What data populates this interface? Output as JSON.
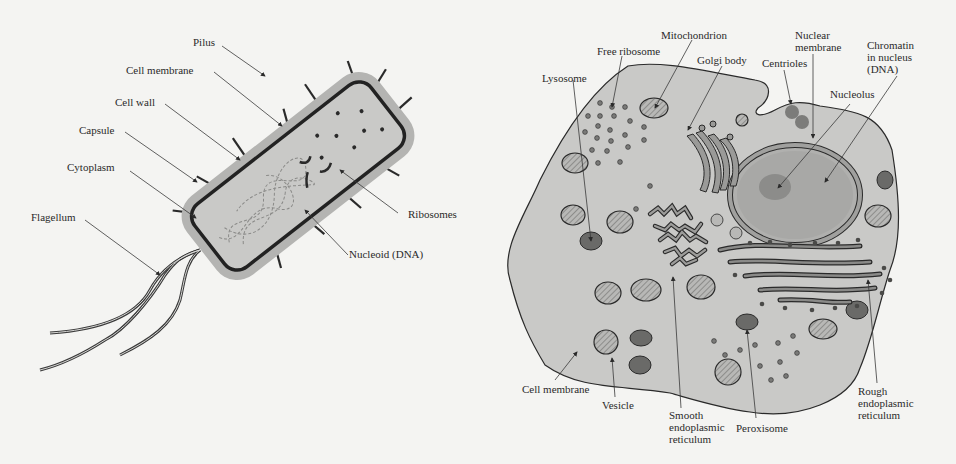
{
  "prokaryote": {
    "labels": {
      "pilus": "Pilus",
      "cell_membrane": "Cell membrane",
      "cell_wall": "Cell wall",
      "capsule": "Capsule",
      "cytoplasm": "Cytoplasm",
      "flagellum": "Flagellum",
      "ribosomes": "Ribosomes",
      "nucleoid": "Nucleoid (DNA)"
    }
  },
  "eukaryote": {
    "labels": {
      "mitochondrion": "Mitochondrion",
      "free_ribosome": "Free ribosome",
      "golgi_body": "Golgi body",
      "lysosome": "Lysosome",
      "nuclear_membrane": "Nuclear\nmembrane",
      "centrioles": "Centrioles",
      "chromatin": "Chromatin\nin nucleus\n(DNA)",
      "nucleolus": "Nucleolus",
      "cell_membrane": "Cell membrane",
      "vesicle": "Vesicle",
      "smooth_er": "Smooth\nendoplasmic\nreticulum",
      "peroxisome": "Peroxisome",
      "rough_er": "Rough\nendoplasmic\nreticulum"
    }
  },
  "colors": {
    "background": "#f4f4f2",
    "capsule": "#b4b4b2",
    "cytoplasm": "#c9c9c7",
    "outline": "#2a2a2a",
    "dark_organelle": "#6a6a68",
    "nucleus": "#a8a8a6",
    "nucleolus": "#8c8c8a"
  }
}
